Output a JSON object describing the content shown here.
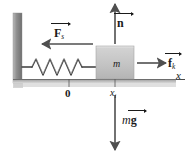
{
  "figure": {
    "background_color": "#ffffff",
    "line_color": "#1a1a1a",
    "wall_color": "#9a9a9a",
    "block_color": "#c9c9c9",
    "arrow_color": "#555555"
  },
  "labels": {
    "spring_force": {
      "symbol": "F",
      "subscript": "s",
      "vector": true,
      "text": "F"
    },
    "normal_force": {
      "symbol": "n",
      "subscript": "",
      "vector": true,
      "text": "n"
    },
    "friction_force": {
      "symbol": "f",
      "subscript": "k",
      "vector": true,
      "text": "f"
    },
    "weight": {
      "prefix": "m",
      "symbol": "g",
      "vector": true,
      "text": "g"
    },
    "mass": "m",
    "origin": "0",
    "initial_position": {
      "symbol": "x",
      "subscript": "i"
    },
    "x_axis": "x"
  },
  "label_subscripts": {
    "spring_force": "s",
    "friction_force": "k",
    "initial_position": "i"
  },
  "weight_prefix": "m",
  "elements": {
    "wall": "vertical-wall-left",
    "ground": "horizontal-ground-line",
    "spring": "coil-spring",
    "block": "mass-block",
    "spring_force_arrow": "arrow-left",
    "normal_arrow": "arrow-up",
    "friction_arrow": "arrow-right",
    "weight_arrow": "arrow-down",
    "axis": "x-axis-line"
  }
}
